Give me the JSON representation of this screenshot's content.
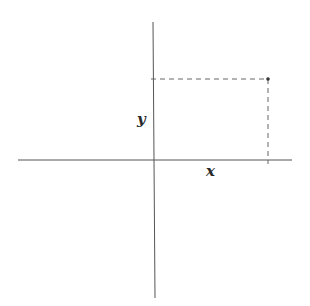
{
  "diagram": {
    "type": "cartesian-point-projection",
    "axes": {
      "horizontal": "x-axis",
      "vertical": "y-axis"
    },
    "labels": {
      "x": "x",
      "y": "y"
    },
    "point": {
      "description": "point in first quadrant with coordinates (x, y)",
      "projections": [
        "dashed line to y-axis",
        "dashed line to x-axis"
      ]
    },
    "colors": {
      "axis": "#555555",
      "dash": "#666666",
      "point": "#333333",
      "text": "#2a2a2a"
    }
  }
}
